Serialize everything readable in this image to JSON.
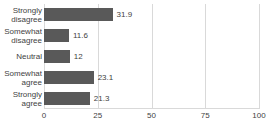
{
  "chart_data": {
    "type": "bar",
    "orientation": "horizontal",
    "title": "",
    "xlabel": "",
    "ylabel": "",
    "categories": [
      "Strongly disagree",
      "Somewhat disagree",
      "Neutral",
      "Somewhat agree",
      "Strongly agree"
    ],
    "category_lines": [
      [
        "Strongly",
        "disagree"
      ],
      [
        "Somewhat",
        "disagree"
      ],
      [
        "Neutral"
      ],
      [
        "Somewhat",
        "agree"
      ],
      [
        "Strongly",
        "agree"
      ]
    ],
    "values": [
      31.9,
      11.6,
      12,
      23.1,
      21.3
    ],
    "value_labels": [
      "31.9",
      "11.6",
      "12",
      "23.1",
      "21.3"
    ],
    "xlim": [
      0,
      100
    ],
    "xticks": [
      0,
      25,
      50,
      75,
      100
    ],
    "xtick_labels": [
      "0",
      "25",
      "50",
      "75",
      "100"
    ],
    "grid": true,
    "grid_axis": "x",
    "legend": false,
    "bar_color": "#595959",
    "grid_color": "#d9d9d9",
    "text_color": "#3f3f3f",
    "background": "#ffffff"
  }
}
